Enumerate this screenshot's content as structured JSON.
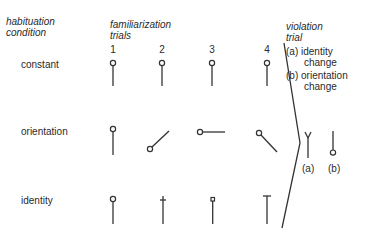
{
  "headers": {
    "habituation": [
      "habituation",
      "condition"
    ],
    "familiarization": [
      "familiarization",
      "trials"
    ],
    "violation": [
      "violation",
      "trial"
    ]
  },
  "trial_numbers": [
    "1",
    "2",
    "3",
    "4"
  ],
  "rows": [
    {
      "label": "constant",
      "stimuli": [
        "vertical-circle-top",
        "vertical-circle-top",
        "vertical-circle-top",
        "vertical-circle-top"
      ]
    },
    {
      "label": "orientation",
      "stimuli": [
        "vertical-circle-top",
        "diagonal-circle-bottom-left",
        "horizontal-circle-left",
        "diagonal-circle-top-left"
      ]
    },
    {
      "label": "identity",
      "stimuli": [
        "vertical-circle-top",
        "vertical-cross-top",
        "vertical-square-top",
        "vertical-bar-top"
      ]
    }
  ],
  "violation": {
    "items": [
      {
        "marker": "(a)",
        "line1": "identity",
        "line2": "change"
      },
      {
        "marker": "(b)",
        "line1": "orientation",
        "line2": "change"
      }
    ],
    "stimuli": [
      {
        "label": "(a)",
        "shape": "vertical-fork-top"
      },
      {
        "label": "(b)",
        "shape": "vertical-circle-bottom"
      }
    ]
  }
}
